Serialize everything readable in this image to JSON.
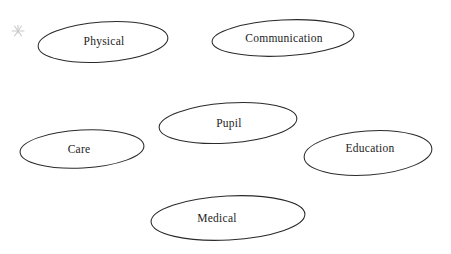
{
  "page": {
    "background_color": "#ffffff",
    "width": 451,
    "height": 254
  },
  "diagram": {
    "type": "concept-map",
    "shape": "ellipse",
    "stroke_color": "#2a2a2a",
    "text_color": "#1c1c1c",
    "fill_color": "none",
    "nodes": [
      {
        "id": "physical",
        "label": "Physical",
        "cx": 103,
        "cy": 42,
        "rx": 65,
        "ry": 20,
        "rotation": -4,
        "label_x": 104,
        "label_y": 42
      },
      {
        "id": "communication",
        "label": "Communication",
        "cx": 283,
        "cy": 38,
        "rx": 71,
        "ry": 18,
        "rotation": -3,
        "label_x": 284,
        "label_y": 39
      },
      {
        "id": "pupil",
        "label": "Pupil",
        "cx": 228,
        "cy": 123,
        "rx": 69,
        "ry": 20,
        "rotation": -4,
        "label_x": 229,
        "label_y": 124
      },
      {
        "id": "care",
        "label": "Care",
        "cx": 82,
        "cy": 149,
        "rx": 62,
        "ry": 19,
        "rotation": -3,
        "label_x": 79,
        "label_y": 150
      },
      {
        "id": "education",
        "label": "Education",
        "cx": 368,
        "cy": 153,
        "rx": 64,
        "ry": 22,
        "rotation": -4,
        "label_x": 370,
        "label_y": 149
      },
      {
        "id": "medical",
        "label": "Medical",
        "cx": 228,
        "cy": 218,
        "rx": 77,
        "ry": 22,
        "rotation": -3,
        "label_x": 217,
        "label_y": 219
      }
    ],
    "marks": [
      {
        "id": "asterisk",
        "name": "asterisk-mark",
        "x": 18,
        "y": 31,
        "size": 9,
        "color": "#c9c9c9"
      }
    ]
  }
}
